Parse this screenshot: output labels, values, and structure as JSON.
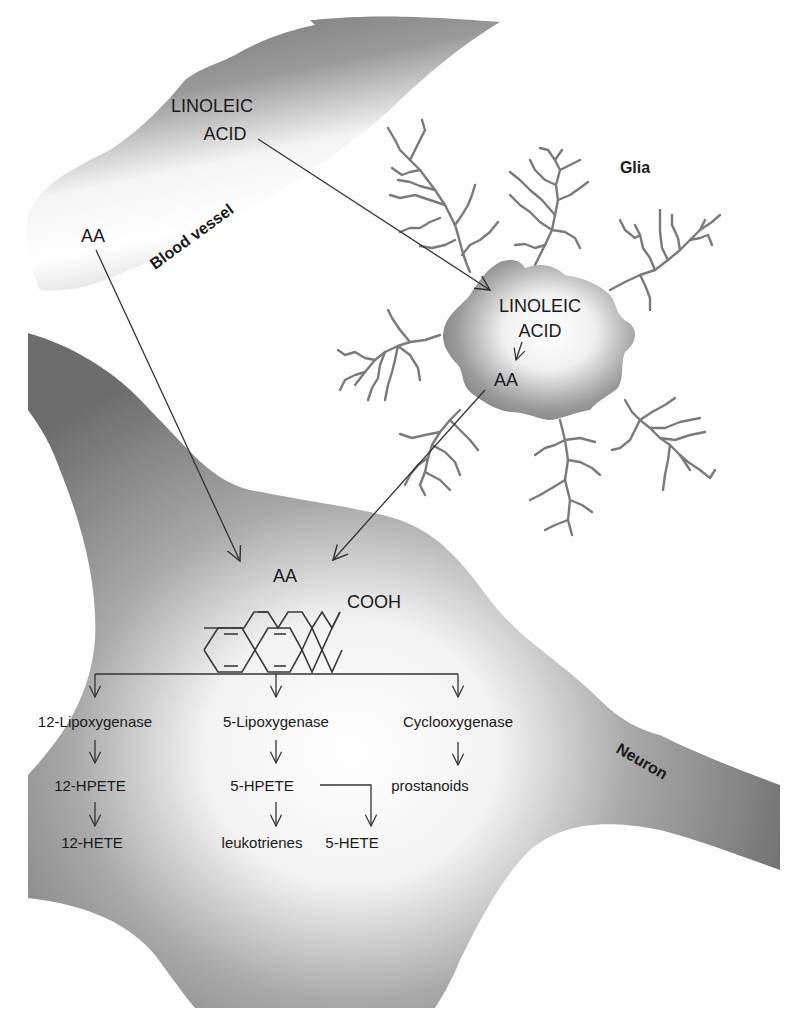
{
  "labels": {
    "blood_vessel": "Blood vessel",
    "glia": "Glia",
    "neuron": "Neuron"
  },
  "blood_vessel": {
    "linoleic_line1": "LINOLEIC",
    "linoleic_line2": "ACID",
    "aa": "AA"
  },
  "glia_cell": {
    "linoleic_line1": "LINOLEIC",
    "linoleic_line2": "ACID",
    "aa": "AA"
  },
  "neuron_cell": {
    "aa": "AA",
    "cooh": "COOH",
    "pathways": [
      {
        "enzyme": "12-Lipoxygenase",
        "steps": [
          "12-HPETE",
          "12-HETE"
        ]
      },
      {
        "enzyme": "5-Lipoxygenase",
        "steps": [
          "5-HPETE",
          "leukotrienes"
        ],
        "side_product": "5-HETE"
      },
      {
        "enzyme": "Cyclooxygenase",
        "steps": [
          "prostanoids"
        ]
      }
    ]
  },
  "colors": {
    "text": "#1a1a1a",
    "arrow": "#333333",
    "dendrite": "#7a7a7a",
    "cell_dark": "#7c7c7c",
    "cell_light": "#ffffff"
  }
}
